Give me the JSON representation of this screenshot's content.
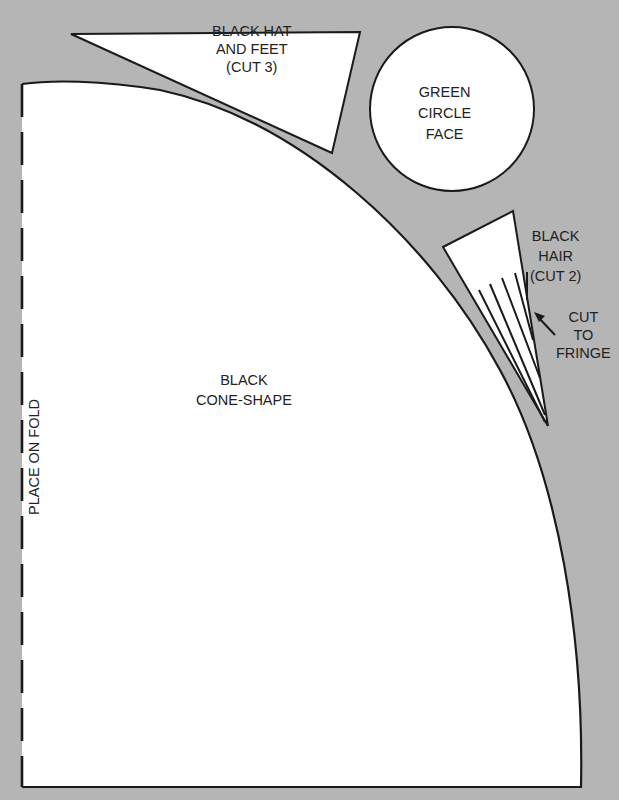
{
  "pieces": {
    "cone": {
      "line1": "BLACK",
      "line2": "CONE-SHAPE"
    },
    "hat": {
      "line1": "BLACK HAT",
      "line2": "AND FEET",
      "line3": "(CUT 3)"
    },
    "face": {
      "line1": "GREEN",
      "line2": "CIRCLE",
      "line3": "FACE"
    },
    "hair": {
      "line1": "BLACK",
      "line2": "HAIR",
      "line3": "(CUT 2)"
    },
    "fringe_note": {
      "line1": "CUT",
      "line2": "TO",
      "line3": "FRINGE"
    },
    "fold_label": "PLACE ON FOLD"
  },
  "colors": {
    "background": "#b5b5b5",
    "paper": "#ffffff",
    "outline": "#1a1a1a"
  }
}
